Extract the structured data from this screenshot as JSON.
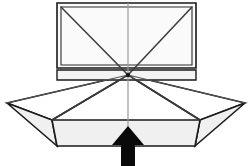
{
  "figure": {
    "title": "Folding panel structure diagram",
    "background_color": "#ffffff",
    "line_color": "#1a1a1a",
    "fill_light": "#f0f0f0",
    "fill_white": "#ffffff",
    "arrow_color": "#0a0a0a",
    "axis_color": "#9a9a9a"
  },
  "geometry": {
    "canvas": {
      "width": 251,
      "height": 166
    },
    "hub": {
      "x": 128,
      "y": 75,
      "label": "convergence-hub"
    },
    "upper_panel": {
      "label": "upper-rectangular-panel",
      "outer": "57,3 196,3 196,68 57,68",
      "inner": "61,7 192,7 192,65 61,65",
      "center_x": 128,
      "diagonals": [
        {
          "from_x": 61,
          "from_y": 7,
          "to_x": 128,
          "to_y": 75
        },
        {
          "from_x": 192,
          "from_y": 7,
          "to_x": 128,
          "to_y": 75
        }
      ]
    },
    "connector_band": {
      "label": "connector-band",
      "points": "57,70 196,70 196,80 57,80"
    },
    "left_wing": {
      "label": "left-wing-facet",
      "points": "7,103 128,75 52,120"
    },
    "right_wing": {
      "label": "right-wing-facet",
      "points": "245,103 128,75 200,120"
    },
    "left_skirt": {
      "label": "left-skirt-facet",
      "points": "7,103 52,120 57,146"
    },
    "right_skirt": {
      "label": "right-skirt-facet",
      "points": "245,103 200,120 195,146"
    },
    "lower_panel": {
      "label": "lower-skirt-panel",
      "points": "52,120 200,120 195,146 57,146"
    },
    "fan_lines": [
      {
        "label": "fan-line-left",
        "from_x": 128,
        "from_y": 75,
        "to_x": 52,
        "to_y": 120
      },
      {
        "label": "fan-line-right",
        "from_x": 128,
        "from_y": 75,
        "to_x": 200,
        "to_y": 120
      },
      {
        "label": "fan-line-outer-left",
        "from_x": 128,
        "from_y": 75,
        "to_x": 7,
        "to_y": 103
      },
      {
        "label": "fan-line-outer-right",
        "from_x": 128,
        "from_y": 75,
        "to_x": 245,
        "to_y": 103
      }
    ],
    "center_axis": {
      "label": "vertical-center-axis",
      "from_x": 128,
      "from_y": 3,
      "to_x": 128,
      "to_y": 146
    },
    "arrow": {
      "label": "upward-direction-arrow",
      "points": "128,126 144,145 135,145 135,166 121,166 121,145 112,145",
      "direction": "up"
    }
  }
}
